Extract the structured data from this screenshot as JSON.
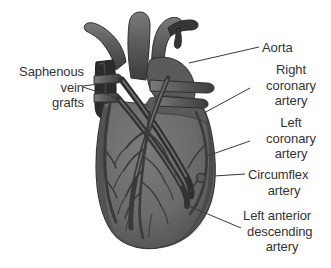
{
  "figure": {
    "background_color": "#ffffff",
    "ink_color": "#343434",
    "heart_fill": "#6e6e6e",
    "heart_shadow": "#4a4a4a",
    "vessel_dark": "#2e2e2e",
    "leader_color": "#3a3a3a"
  },
  "labels": {
    "saphenous": {
      "lines": [
        "Saphenous",
        "vein",
        "grafts"
      ],
      "align": "right",
      "x": 12,
      "y": 64
    },
    "aorta": {
      "lines": [
        "Aorta"
      ],
      "align": "left",
      "x": 262,
      "y": 40
    },
    "right_coronary": {
      "lines": [
        "Right",
        "coronary",
        "artery"
      ],
      "align": "left",
      "x": 253,
      "y": 62
    },
    "left_coronary": {
      "lines": [
        "Left",
        "coronary",
        "artery"
      ],
      "align": "left",
      "x": 253,
      "y": 115
    },
    "circumflex": {
      "lines": [
        "Circumflex",
        "artery"
      ],
      "align": "left",
      "x": 248,
      "y": 167
    },
    "lad": {
      "lines": [
        "Left anterior",
        "descending",
        "artery"
      ],
      "align": "left",
      "x": 243,
      "y": 208
    }
  },
  "leaders": [
    {
      "name": "aorta-leader",
      "from": [
        259,
        47
      ],
      "to": [
        189,
        63
      ]
    },
    {
      "name": "right-coronary-leader",
      "from": [
        250,
        88
      ],
      "to": [
        204,
        113
      ]
    },
    {
      "name": "left-coronary-leader",
      "from": [
        250,
        141
      ],
      "to": [
        207,
        156
      ]
    },
    {
      "name": "circumflex-leader",
      "from": [
        245,
        174
      ],
      "to": [
        214,
        176
      ]
    },
    {
      "name": "lad-leader",
      "from": [
        241,
        228
      ],
      "to": [
        184,
        204
      ]
    },
    {
      "name": "saphenous-leader-upper",
      "from": [
        83,
        86
      ],
      "to": [
        123,
        81
      ]
    },
    {
      "name": "saphenous-leader-lower",
      "from": [
        83,
        87
      ],
      "to": [
        120,
        99
      ]
    }
  ]
}
